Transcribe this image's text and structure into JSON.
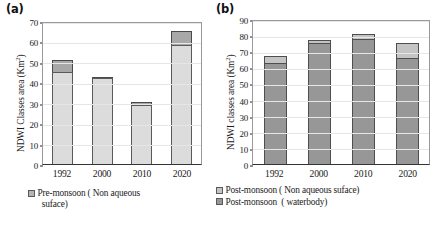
{
  "figure": {
    "panel_a_label": "(a)",
    "panel_b_label": "(b)"
  },
  "chart_data": [
    {
      "id": "panel-a",
      "type": "bar",
      "stacked": true,
      "title": "(a)",
      "xlabel": "",
      "ylabel": "NDWI  Classes area (Km²)",
      "ylim": [
        0,
        70
      ],
      "ytick_step": 10,
      "yticks": [
        0,
        10,
        20,
        30,
        40,
        50,
        60,
        70
      ],
      "grid": true,
      "legend_position": "bottom-left",
      "categories": [
        "1992",
        "2000",
        "2010",
        "2020"
      ],
      "series": [
        {
          "name": "Pre-monsoon ( waterbody)",
          "color": "#dcdcdc",
          "values": [
            45,
            42,
            29,
            58.5
          ]
        },
        {
          "name": "Pre-monsoon ( Non aqueous suface)",
          "color": "#a8a8a8",
          "values": [
            6,
            0.8,
            1.5,
            6.5
          ]
        }
      ],
      "totals": [
        51,
        42.8,
        30.5,
        65
      ],
      "legend": [
        {
          "label": "Pre-monsoon ( Non aqueous\n  suface)",
          "color": "#b4b4b4"
        }
      ]
    },
    {
      "id": "panel-b",
      "type": "bar",
      "stacked": true,
      "title": "(b)",
      "xlabel": "",
      "ylabel": "NDWI classes area (Km²)",
      "ylim": [
        0,
        90
      ],
      "ytick_step": 10,
      "yticks": [
        0,
        10,
        20,
        30,
        40,
        50,
        60,
        70,
        80,
        90
      ],
      "grid": true,
      "legend_position": "bottom-left",
      "categories": [
        "1992",
        "2000",
        "2010",
        "2020"
      ],
      "series": [
        {
          "name": "Post-monsoon  ( waterbody)",
          "color": "#979797",
          "values": [
            62.5,
            75,
            77.5,
            66
          ]
        },
        {
          "name": "Post-monsoon ( Non aqueous suface)",
          "color": "#c4c4c4",
          "values": [
            4.5,
            2,
            3.5,
            9
          ]
        }
      ],
      "totals": [
        67,
        77,
        81,
        75
      ],
      "legend": [
        {
          "label": "Post-monsoon ( Non aqueous suface)",
          "color": "#c4c4c4"
        },
        {
          "label": "Post-monsoon  ( waterbody)",
          "color": "#979797"
        }
      ]
    }
  ]
}
